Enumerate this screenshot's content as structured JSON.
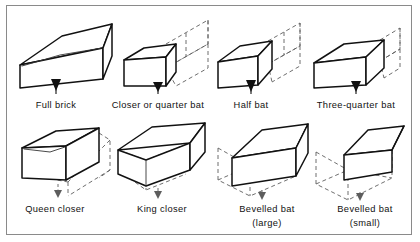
{
  "figure": {
    "domain": "technical-line-drawing",
    "projection": "isometric",
    "frame": {
      "visible": true,
      "color": "#8a8a8a"
    },
    "background_color": "#ffffff",
    "line_color": "#111111",
    "hidden_line_color": "#5d5d5d",
    "hidden_line_style": "dashed"
  },
  "legend": {
    "solid_means": "remaining brick",
    "dashed_means": "cut-away portion of full brick"
  },
  "items": [
    {
      "id": "full-brick",
      "label": "Full brick",
      "label_line2": "",
      "row": 1,
      "col": 1,
      "has_dashed_ghost": false
    },
    {
      "id": "closer-quarter-bat",
      "label": "Closer or quarter bat",
      "label_line2": "",
      "row": 1,
      "col": 2,
      "has_dashed_ghost": true
    },
    {
      "id": "half-bat",
      "label": "Half bat",
      "label_line2": "",
      "row": 1,
      "col": 3,
      "has_dashed_ghost": true
    },
    {
      "id": "three-quarter-bat",
      "label": "Three-quarter bat",
      "label_line2": "",
      "row": 1,
      "col": 4,
      "has_dashed_ghost": true
    },
    {
      "id": "queen-closer",
      "label": "Queen closer",
      "label_line2": "",
      "row": 2,
      "col": 1,
      "has_dashed_ghost": true
    },
    {
      "id": "king-closer",
      "label": "King closer",
      "label_line2": "",
      "row": 2,
      "col": 2,
      "has_dashed_ghost": true
    },
    {
      "id": "bevelled-bat-large",
      "label": "Bevelled bat",
      "label_line2": "(large)",
      "row": 2,
      "col": 3,
      "has_dashed_ghost": true
    },
    {
      "id": "bevelled-bat-small",
      "label": "Bevelled bat",
      "label_line2": "(small)",
      "row": 2,
      "col": 4,
      "has_dashed_ghost": true
    }
  ]
}
